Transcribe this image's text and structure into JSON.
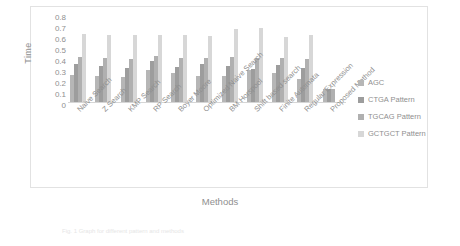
{
  "chart_data": {
    "type": "bar",
    "title": "",
    "xlabel": "Methods",
    "ylabel": "Time",
    "ylim": [
      0,
      0.8
    ],
    "grid": false,
    "legend_position": "right",
    "yticks": [
      "0.8",
      "0.7",
      "0.6",
      "0.5",
      "0.4",
      "0.3",
      "0.2",
      "0.1",
      "0"
    ],
    "categories": [
      "Naive Search",
      "Z Search",
      "KMP Search",
      "RP Search",
      "Boyer Moore",
      "Optimized Naive Search",
      "BM Horspool",
      "Shift based search",
      "Finite Automata",
      "Regular Expression",
      "Proposed Method"
    ],
    "series": [
      {
        "name": "AGC",
        "color": "#b6b6b6",
        "values": [
          0.25,
          0.24,
          0.23,
          0.29,
          0.26,
          0.24,
          0.24,
          0.29,
          0.26,
          0.21,
          0.12
        ]
      },
      {
        "name": "CTGA Pattern",
        "color": "#9d9d9d",
        "values": [
          0.35,
          0.33,
          0.31,
          0.37,
          0.32,
          0.35,
          0.33,
          0.3,
          0.34,
          0.31,
          0.12
        ]
      },
      {
        "name": "TGCAG Pattern",
        "color": "#b0b0b0",
        "values": [
          0.41,
          0.4,
          0.39,
          0.42,
          0.4,
          0.4,
          0.41,
          0.4,
          0.4,
          0.39,
          0.12
        ]
      },
      {
        "name": "GCTGCT Pattern",
        "color": "#d7d7d7",
        "values": [
          0.62,
          0.61,
          0.61,
          0.61,
          0.61,
          0.6,
          0.66,
          0.67,
          0.59,
          0.61,
          0.0
        ]
      }
    ]
  },
  "caption": "Fig. 1  Graph for different pattern and methods",
  "legend": {
    "items": [
      {
        "label": "AGC",
        "color": "#b6b6b6"
      },
      {
        "label": "CTGA Pattern",
        "color": "#9d9d9d"
      },
      {
        "label": "TGCAG Pattern",
        "color": "#b0b0b0"
      },
      {
        "label": "GCTGCT Pattern",
        "color": "#d7d7d7"
      }
    ]
  }
}
